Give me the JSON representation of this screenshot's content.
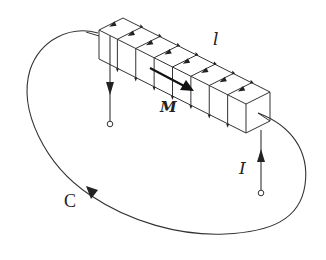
{
  "diagram": {
    "type": "solenoid-magnetization-loop",
    "labels": {
      "length": "l",
      "magnetization": "M",
      "current": "I",
      "contour": "C"
    },
    "segments": 8,
    "colors": {
      "line": "#333333",
      "text": "#222222",
      "background": "#ffffff"
    }
  }
}
